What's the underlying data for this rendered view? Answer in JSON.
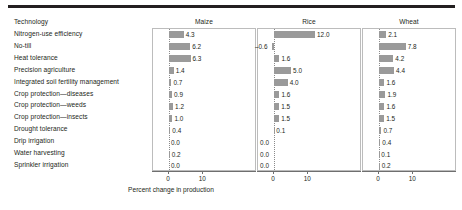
{
  "figure": {
    "x_axis_title": "Percent change in production",
    "row_header": "Technology",
    "tick_labels": [
      "0",
      "10"
    ],
    "colors": {
      "bar": "#9a9a9a",
      "rule": "#231f20",
      "panel_border": "#bcbcbc",
      "zero_gridline": "#8a8a8a",
      "text": "#231f20"
    }
  },
  "chart_data": {
    "type": "bar",
    "title": "",
    "subtitle": "",
    "xlabel": "Percent change in production",
    "ylabel": "Technology",
    "orientation": "horizontal",
    "grid": false,
    "legend_position": "none",
    "xlim": [
      -3,
      14
    ],
    "xticks": [
      0,
      10
    ],
    "panels": [
      "Maize",
      "Rice",
      "Wheat"
    ],
    "categories": [
      "Nitrogen-use efficiency",
      "No-till",
      "Heat tolerance",
      "Precision agriculture",
      "Integrated soil fertility management",
      "Crop protection—diseases",
      "Crop protection—weeds",
      "Crop protection—insects",
      "Drought tolerance",
      "Drip irrigation",
      "Water harvesting",
      "Sprinkler irrigation"
    ],
    "series": [
      {
        "name": "Maize",
        "values": [
          4.3,
          6.2,
          6.3,
          1.4,
          0.7,
          0.9,
          1.2,
          1.0,
          0.4,
          0.0,
          0.2,
          0.0
        ],
        "labels": [
          "4.3",
          "6.2",
          "6.3",
          "1.4",
          "0.7",
          "0.9",
          "1.2",
          "1.0",
          "0.4",
          "0.0",
          "0.2",
          "0.0"
        ]
      },
      {
        "name": "Rice",
        "values": [
          12.0,
          -0.6,
          1.6,
          5.0,
          4.0,
          1.6,
          1.5,
          1.5,
          0.1,
          0.0,
          0.0,
          0.0
        ],
        "labels": [
          "12.0",
          "–0.6",
          "1.6",
          "5.0",
          "4.0",
          "1.6",
          "1.5",
          "1.5",
          "0.1",
          "0.0",
          "0.0",
          "0.0"
        ]
      },
      {
        "name": "Wheat",
        "values": [
          2.1,
          7.8,
          4.2,
          4.4,
          1.6,
          1.9,
          1.6,
          1.5,
          0.7,
          0.4,
          0.1,
          0.2
        ],
        "labels": [
          "2.1",
          "7.8",
          "4.2",
          "4.4",
          "1.6",
          "1.9",
          "1.6",
          "1.5",
          "0.7",
          "0.4",
          "0.1",
          "0.2"
        ]
      }
    ]
  }
}
